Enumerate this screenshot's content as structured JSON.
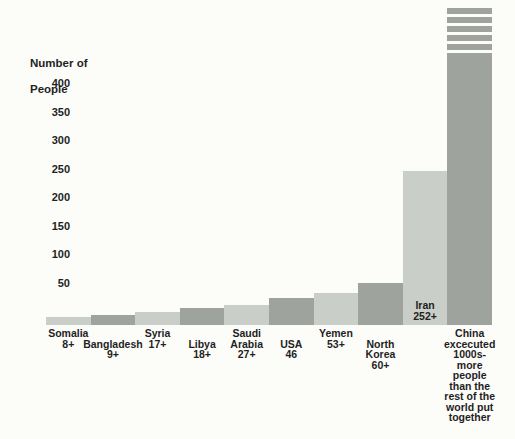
{
  "chart_data": {
    "type": "bar",
    "title": "",
    "ylabel_lines": [
      "Number of",
      "People"
    ],
    "xlabel": "",
    "yticks": [
      400,
      350,
      300,
      250,
      200,
      150,
      100,
      50
    ],
    "ylim": [
      0,
      450
    ],
    "grid": false,
    "legend": "none",
    "categories": [
      "Somalia",
      "Bangladesh",
      "Syria",
      "Libya",
      "Saudi Arabia",
      "USA",
      "Yemen",
      "North Korea",
      "Iran",
      "China"
    ],
    "values": [
      8,
      9,
      17,
      18,
      27,
      46,
      53,
      60,
      252,
      1000
    ],
    "annotation": "China excecuted 1000s- more people than the rest of the world put together",
    "bars": [
      {
        "country": "Somalia",
        "value": 8,
        "value_label": "8+",
        "shade": "light",
        "label_placement": "below",
        "label_row": 0,
        "label_lines": [
          "Somalia",
          "8+"
        ],
        "height_px": 8
      },
      {
        "country": "Bangladesh",
        "value": 9,
        "value_label": "9+",
        "shade": "dark",
        "label_placement": "below",
        "label_row": 1,
        "label_lines": [
          "Bangladesh",
          "9+"
        ],
        "height_px": 10
      },
      {
        "country": "Syria",
        "value": 17,
        "value_label": "17+",
        "shade": "light",
        "label_placement": "below",
        "label_row": 0,
        "label_lines": [
          "Syria",
          "17+"
        ],
        "height_px": 13
      },
      {
        "country": "Libya",
        "value": 18,
        "value_label": "18+",
        "shade": "dark",
        "label_placement": "below",
        "label_row": 1,
        "label_lines": [
          "Libya",
          "18+"
        ],
        "height_px": 17
      },
      {
        "country": "Saudi Arabia",
        "value": 27,
        "value_label": "27+",
        "shade": "light",
        "label_placement": "below",
        "label_row": 0,
        "label_lines": [
          "Saudi",
          "Arabia",
          "27+"
        ],
        "height_px": 20
      },
      {
        "country": "USA",
        "value": 46,
        "value_label": "46",
        "shade": "dark",
        "label_placement": "below",
        "label_row": 1,
        "label_lines": [
          "USA",
          "46"
        ],
        "height_px": 27
      },
      {
        "country": "Yemen",
        "value": 53,
        "value_label": "53+",
        "shade": "light",
        "label_placement": "below",
        "label_row": 0,
        "label_lines": [
          "Yemen",
          "53+"
        ],
        "height_px": 32
      },
      {
        "country": "North Korea",
        "value": 60,
        "value_label": "60+",
        "shade": "dark",
        "label_placement": "below",
        "label_row": 1,
        "label_lines": [
          "North",
          "Korea",
          "60+"
        ],
        "height_px": 42
      },
      {
        "country": "Iran",
        "value": 252,
        "value_label": "252+",
        "shade": "light",
        "label_placement": "inside",
        "label_row": 0,
        "label_lines": [
          "Iran",
          "252+"
        ],
        "height_px": 154
      },
      {
        "country": "China",
        "value": 1000,
        "value_label": "1000s-",
        "shade": "dark",
        "label_placement": "below",
        "label_row": 0,
        "label_lines": [
          "China",
          "excecuted",
          "1000s-",
          "more",
          "people",
          "than the",
          "rest of the",
          "world put",
          "together"
        ],
        "height_px": 272,
        "overflow_stripes": 5
      }
    ],
    "colors": {
      "bar_light": "#cacec9",
      "bar_dark": "#9ea39d",
      "text": "#1f1f1f",
      "background": "#fcfcf9"
    }
  }
}
